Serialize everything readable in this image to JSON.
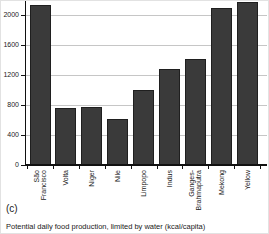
{
  "panel_label": "(c)",
  "caption": "Potential daily food production, limited by water (kcal/capita)",
  "colors": {
    "bar_fill": "#3a3a3a",
    "bar_edge": "#1f1f1f",
    "gridline": "#c6c6c6",
    "axis": "#111111",
    "text": "#1a1a1a",
    "background": "#ffffff"
  },
  "chart_data": {
    "type": "bar",
    "categories": [
      "São Francisco",
      "Volta",
      "Niger",
      "Nile",
      "Limpopo",
      "Indus",
      "Ganges-Brahmaputra",
      "Mekong",
      "Yellow"
    ],
    "category_display": [
      "São\nFrancisco",
      "Volta",
      "Niger",
      "Nile",
      "Limpopo",
      "Indus",
      "Ganges-\nBrahmaputra",
      "Mekong",
      "Yellow"
    ],
    "values": [
      2130,
      760,
      780,
      620,
      1000,
      1280,
      1410,
      2090,
      2170
    ],
    "title": "Potential daily food production, limited by water (kcal/capita)",
    "xlabel": "",
    "ylabel": "",
    "ylim": [
      0,
      2200
    ],
    "yticks": [
      0,
      400,
      800,
      1200,
      1600,
      2000
    ],
    "grid": true,
    "legend": false
  }
}
